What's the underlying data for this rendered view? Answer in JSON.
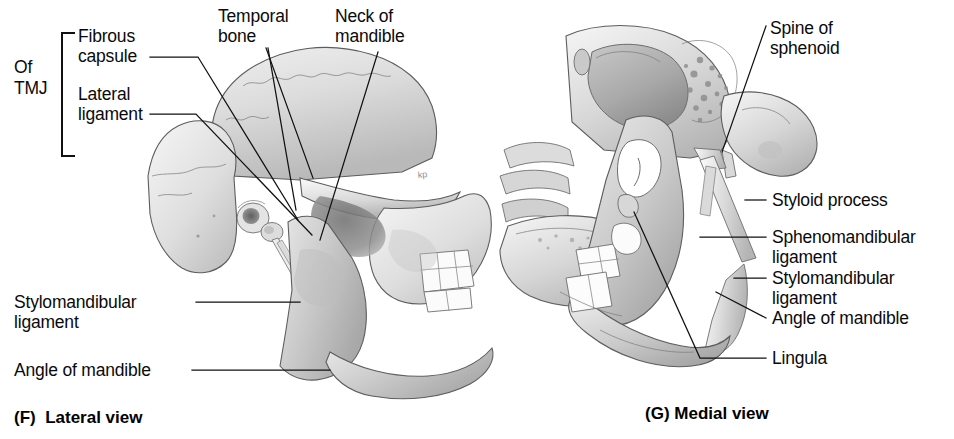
{
  "figure": {
    "background_color": "#ffffff",
    "ink_color": "#0a0a0a",
    "bone_fill_light": "#f2f2f2",
    "bone_fill_mid": "#cfcfcf",
    "bone_fill_dark": "#9a9a9a"
  },
  "panels": [
    {
      "id": "F",
      "caption": "(F)  Lateral view",
      "caption_letter": "(F)",
      "caption_text": "Lateral view",
      "group_label": {
        "line1": "Of",
        "line2": "TMJ",
        "bracket": true
      },
      "labels": [
        {
          "id": "fibrous-capsule",
          "line1": "Fibrous",
          "line2": "capsule"
        },
        {
          "id": "lateral-ligament",
          "line1": "Lateral",
          "line2": "ligament"
        },
        {
          "id": "temporal-bone",
          "line1": "Temporal",
          "line2": "bone"
        },
        {
          "id": "neck-of-mandible",
          "line1": "Neck of",
          "line2": "mandible"
        },
        {
          "id": "stylomandibular-ligament",
          "line1": "Stylomandibular",
          "line2": "ligament"
        },
        {
          "id": "angle-of-mandible",
          "line1": "Angle of mandible",
          "line2": ""
        }
      ]
    },
    {
      "id": "G",
      "caption": "(G) Medial view",
      "caption_letter": "(G)",
      "caption_text": "Medial view",
      "labels": [
        {
          "id": "spine-of-sphenoid",
          "line1": "Spine of",
          "line2": "sphenoid"
        },
        {
          "id": "styloid-process",
          "line1": "Styloid process",
          "line2": ""
        },
        {
          "id": "sphenomandibular-ligament",
          "line1": "Sphenomandibular",
          "line2": "ligament"
        },
        {
          "id": "stylomandibular-ligament-g",
          "line1": "Stylomandibular",
          "line2": "ligament"
        },
        {
          "id": "angle-of-mandible-g",
          "line1": "Angle of mandible",
          "line2": ""
        },
        {
          "id": "lingula",
          "line1": "Lingula",
          "line2": ""
        }
      ]
    }
  ],
  "signature": "kp"
}
